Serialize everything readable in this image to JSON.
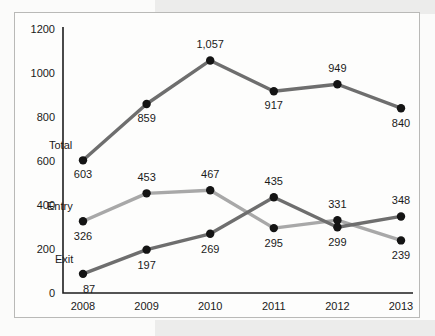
{
  "chart_data": {
    "type": "line",
    "title": "",
    "xlabel": "",
    "ylabel": "",
    "categories": [
      "2008",
      "2009",
      "2010",
      "2011",
      "2012",
      "2013"
    ],
    "ylim": [
      0,
      1200
    ],
    "ytick_labels": [
      "0",
      "200",
      "400",
      "600",
      "800",
      "1000",
      "1200"
    ],
    "ytick_values": [
      0,
      200,
      400,
      600,
      800,
      1000,
      1200
    ],
    "grid": false,
    "legend_position": "inline-left-labels",
    "series": [
      {
        "name": "Total",
        "color": "#6e6e6e",
        "values": [
          603,
          859,
          1057,
          917,
          949,
          840
        ],
        "value_labels": [
          "603",
          "859",
          "1,057",
          "917",
          "949",
          "840"
        ]
      },
      {
        "name": "Entry",
        "color": "#a8a8a8",
        "values": [
          326,
          453,
          467,
          295,
          331,
          239
        ],
        "value_labels": [
          "326",
          "453",
          "467",
          "295",
          "331",
          "239"
        ]
      },
      {
        "name": "Exit",
        "color": "#6e6e6e",
        "values": [
          87,
          197,
          269,
          435,
          299,
          348
        ],
        "value_labels": [
          "87",
          "197",
          "269",
          "435",
          "299",
          "348"
        ]
      }
    ]
  },
  "colors": {
    "dark_line": "#6e6e6e",
    "light_line": "#a8a8a8",
    "marker": "#141414",
    "axis": "#1d1d1d",
    "frame_border": "#b9b9b7",
    "page_band": "#ececeb"
  }
}
